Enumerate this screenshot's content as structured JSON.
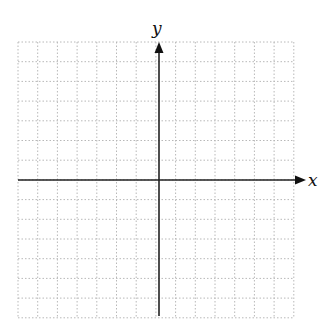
{
  "diagram": {
    "type": "coordinate-plane",
    "x_axis_label": "x",
    "y_axis_label": "y",
    "grid": {
      "left": 18,
      "top": 42,
      "cell": 19.7,
      "cols": 14,
      "rows": 14,
      "line_color": "#b8b8b8",
      "style": "dotted"
    },
    "origin": {
      "px": 159,
      "py": 180
    },
    "axis_color": "#222222",
    "x_axis": {
      "start": 18,
      "end": 306
    },
    "y_axis": {
      "start": 316,
      "end": 42
    }
  }
}
